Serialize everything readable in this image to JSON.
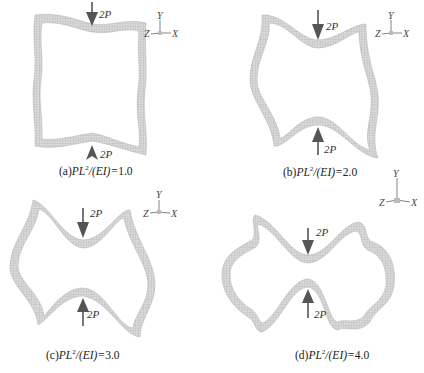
{
  "figure": {
    "panels": [
      {
        "id": "a",
        "caption_prefix": "(a)",
        "caption_expr": "PL",
        "caption_exp": "2",
        "caption_mid": "/(EI)=",
        "caption_value": "1.0",
        "load_top": "2P",
        "load_bottom": "2P",
        "axes": {
          "y": "Y",
          "z": "Z",
          "x": "X"
        }
      },
      {
        "id": "b",
        "caption_prefix": "(b)",
        "caption_expr": "PL",
        "caption_exp": "2",
        "caption_mid": "/(EI)=",
        "caption_value": "2.0",
        "load_top": "2P",
        "load_bottom": "2P",
        "axes": {
          "y": "Y",
          "z": "Z",
          "x": "X"
        }
      },
      {
        "id": "c",
        "caption_prefix": "(c)",
        "caption_expr": "PL",
        "caption_exp": "2",
        "caption_mid": "/(EI)=",
        "caption_value": "3.0",
        "load_top": "2P",
        "load_bottom": "2P",
        "axes": {
          "y": "Y",
          "z": "Z",
          "x": "X"
        }
      },
      {
        "id": "d",
        "caption_prefix": "(d)",
        "caption_expr": "PL",
        "caption_exp": "2",
        "caption_mid": "/(EI)=",
        "caption_value": "4.0",
        "load_top": "2P",
        "load_bottom": "2P",
        "axes": {
          "y": "Y",
          "z": "Z",
          "x": "X"
        }
      }
    ],
    "colors": {
      "mesh_fill": "#d4d4d4",
      "mesh_line": "#9a9a9a",
      "arrow": "#555555",
      "text": "#222222"
    }
  }
}
